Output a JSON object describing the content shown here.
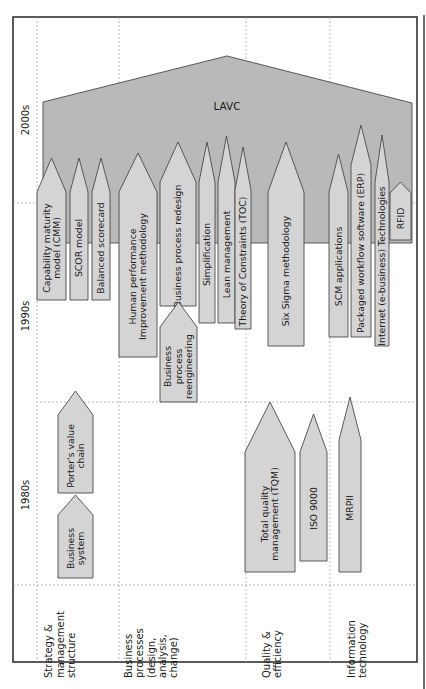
{
  "diagram": {
    "type": "rotated-timeline",
    "colors": {
      "lavc_fill": "#b9b9b9",
      "arrow_fill": "#d4d4d4",
      "outline": "#4a4a4a",
      "grid": "#9a9a9a",
      "text": "#1a1a1a"
    },
    "eras": [
      {
        "label": "2000s",
        "x": 25,
        "y": 120
      },
      {
        "label": "1990s",
        "x": 25,
        "y": 316
      },
      {
        "label": "1980s",
        "x": 25,
        "y": 495
      }
    ],
    "categories": [
      {
        "lines": [
          "Strategy &",
          "management",
          "structure"
        ],
        "x": 60,
        "y": 678
      },
      {
        "lines": [
          "Business",
          "processes",
          "(design,",
          "analysis,",
          "change)"
        ],
        "x": 151,
        "y": 678
      },
      {
        "lines": [
          "Quality &",
          "efficiency"
        ],
        "x": 272,
        "y": 678
      },
      {
        "lines": [
          "Information",
          "technology"
        ],
        "x": 357,
        "y": 678
      }
    ],
    "lavc": {
      "label": "LAVC",
      "points": "43,243 43,102 227,56 412,103 412,243",
      "label_x": 227,
      "label_y": 110
    },
    "arrows": [
      {
        "id": "cmm",
        "lines": [
          "Capability maturity",
          "model (CMM)"
        ],
        "x1": 37,
        "x2": 66,
        "tip": 158,
        "shoulder": 192,
        "bottom": 300,
        "column": "Strategy & management structure"
      },
      {
        "id": "scor",
        "lines": [
          "SCOR model"
        ],
        "x1": 70,
        "x2": 88,
        "tip": 158,
        "shoulder": 192,
        "bottom": 300,
        "column": "Strategy & management structure"
      },
      {
        "id": "bsc",
        "lines": [
          "Balanced scorecard"
        ],
        "x1": 92,
        "x2": 110,
        "tip": 158,
        "shoulder": 192,
        "bottom": 300,
        "column": "Strategy & management structure"
      },
      {
        "id": "hpi",
        "lines": [
          "Human performance",
          "Improvement methodology"
        ],
        "x1": 119,
        "x2": 157,
        "tip": 153,
        "shoulder": 192,
        "bottom": 357,
        "column": "Business processes"
      },
      {
        "id": "bpr-design",
        "lines": [
          "Business process redesign"
        ],
        "x1": 160,
        "x2": 196,
        "tip": 142,
        "shoulder": 182,
        "bottom": 306,
        "column": "Business processes"
      },
      {
        "id": "bp-reengineering",
        "lines": [
          "Business",
          "process",
          "reengineering"
        ],
        "x1": 160,
        "x2": 197,
        "tip": 302,
        "shoulder": 327,
        "bottom": 402,
        "column": "Business processes"
      },
      {
        "id": "simplification",
        "lines": [
          "Simplification"
        ],
        "x1": 199,
        "x2": 215,
        "tip": 142,
        "shoulder": 182,
        "bottom": 323,
        "column": "Business processes"
      },
      {
        "id": "lean",
        "lines": [
          "Lean management"
        ],
        "x1": 218,
        "x2": 235,
        "tip": 136,
        "shoulder": 182,
        "bottom": 323,
        "column": "Business processes"
      },
      {
        "id": "toc",
        "lines": [
          "Theory of Constraints (TOC)"
        ],
        "x1": 235,
        "x2": 251,
        "tip": 147,
        "shoulder": 190,
        "bottom": 329,
        "column": "Business processes"
      },
      {
        "id": "six-sigma",
        "lines": [
          "Six Sigma methodology"
        ],
        "x1": 268,
        "x2": 304,
        "tip": 142,
        "shoulder": 192,
        "bottom": 346,
        "column": "Quality & efficiency"
      },
      {
        "id": "scm",
        "lines": [
          "SCM applications"
        ],
        "x1": 329,
        "x2": 348,
        "tip": 154,
        "shoulder": 192,
        "bottom": 337,
        "column": "Information technology"
      },
      {
        "id": "erp",
        "lines": [
          "Packaged workflow software (ERP)"
        ],
        "x1": 351,
        "x2": 371,
        "tip": 125,
        "shoulder": 165,
        "bottom": 337,
        "column": "Information technology"
      },
      {
        "id": "internet",
        "lines": [
          "Internet (e-business) Technologies"
        ],
        "x1": 375,
        "x2": 389,
        "tip": 135,
        "shoulder": 182,
        "bottom": 346,
        "column": "Information technology"
      },
      {
        "id": "rfid",
        "lines": [
          "RFID"
        ],
        "x1": 390,
        "x2": 411,
        "tip": 182,
        "shoulder": 193,
        "bottom": 240,
        "column": "Information technology"
      },
      {
        "id": "business-system",
        "lines": [
          "Business",
          "system"
        ],
        "x1": 58,
        "x2": 93,
        "tip": 495,
        "shoulder": 515,
        "bottom": 578,
        "column": "Strategy & management structure"
      },
      {
        "id": "porters-value-chain",
        "lines": [
          "Porter's value",
          "chain"
        ],
        "x1": 58,
        "x2": 93,
        "tip": 391,
        "shoulder": 415,
        "bottom": 493,
        "column": "Strategy & management structure"
      },
      {
        "id": "tqm",
        "lines": [
          "Total quality",
          "management (TQM)"
        ],
        "x1": 245,
        "x2": 295,
        "tip": 402,
        "shoulder": 452,
        "bottom": 572,
        "column": "Quality & efficiency"
      },
      {
        "id": "iso9000",
        "lines": [
          "ISO 9000"
        ],
        "x1": 300,
        "x2": 327,
        "tip": 414,
        "shoulder": 452,
        "bottom": 561,
        "column": "Quality & efficiency"
      },
      {
        "id": "mrpii",
        "lines": [
          "MRPII"
        ],
        "x1": 339,
        "x2": 361,
        "tip": 397,
        "shoulder": 440,
        "bottom": 572,
        "column": "Information technology"
      }
    ]
  }
}
